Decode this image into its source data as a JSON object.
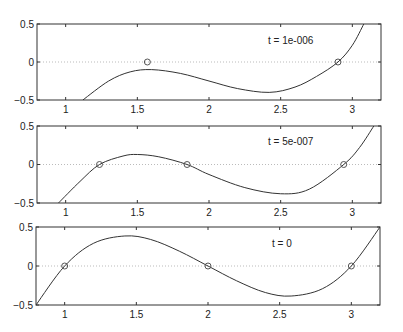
{
  "chart_data": [
    {
      "type": "line",
      "title": "",
      "annotation": "t = 1e-006",
      "xlabel": "",
      "ylabel": "",
      "xlim": [
        0.8,
        3.2
      ],
      "ylim": [
        -0.5,
        0.5
      ],
      "xticks": [
        1,
        1.5,
        2,
        2.5,
        3
      ],
      "xticklabels": [
        "1",
        "1.5",
        "2",
        "2.5",
        "3"
      ],
      "yticks": [
        -0.5,
        0,
        0.5
      ],
      "yticklabels": [
        "-0.5",
        "0",
        "0.5"
      ],
      "zero_line": true,
      "curve": {
        "description": "cubic with local max near (1.6, -0.1) and local min near (2.4, -0.4), crossing zero near x=2.9",
        "x": [
          1.12,
          1.3,
          1.45,
          1.6,
          1.8,
          2.0,
          2.2,
          2.42,
          2.6,
          2.75,
          2.9,
          3.0,
          3.08
        ],
        "y": [
          -0.5,
          -0.25,
          -0.13,
          -0.1,
          -0.15,
          -0.25,
          -0.35,
          -0.4,
          -0.33,
          -0.19,
          0.0,
          0.22,
          0.5
        ]
      },
      "markers": {
        "shape": "circle",
        "points": [
          [
            1.57,
            0.0
          ],
          [
            2.9,
            0.0
          ]
        ]
      }
    },
    {
      "type": "line",
      "title": "",
      "annotation": "t = 5e-007",
      "xlabel": "",
      "ylabel": "",
      "xlim": [
        0.8,
        3.2
      ],
      "ylim": [
        -0.5,
        0.5
      ],
      "xticks": [
        1,
        1.5,
        2,
        2.5,
        3
      ],
      "xticklabels": [
        "1",
        "1.5",
        "2",
        "2.5",
        "3"
      ],
      "yticks": [
        -0.5,
        0,
        0.5
      ],
      "yticklabels": [
        "-0.5",
        "0",
        "0.5"
      ],
      "zero_line": true,
      "curve": {
        "description": "cubic with roots near 1.24, 1.85, 2.94; local max ~0.13 near x=1.5, local min ~-0.38 near x=2.5",
        "x": [
          0.95,
          1.1,
          1.236,
          1.4,
          1.5,
          1.65,
          1.847,
          2.0,
          2.25,
          2.5,
          2.7,
          2.94,
          3.05,
          3.15
        ],
        "y": [
          -0.5,
          -0.22,
          0.0,
          0.11,
          0.13,
          0.1,
          0.0,
          -0.13,
          -0.3,
          -0.38,
          -0.32,
          0.0,
          0.22,
          0.5
        ]
      },
      "markers": {
        "shape": "circle",
        "points": [
          [
            1.236,
            0.0
          ],
          [
            1.847,
            0.0
          ],
          [
            2.94,
            0.0
          ]
        ]
      }
    },
    {
      "type": "line",
      "title": "",
      "annotation": "t = 0",
      "xlabel": "",
      "ylabel": "",
      "xlim": [
        0.8,
        3.2
      ],
      "ylim": [
        -0.5,
        0.5
      ],
      "xticks": [
        1,
        1.5,
        2,
        2.5,
        3
      ],
      "xticklabels": [
        "1",
        "1.5",
        "2",
        "2.5",
        "3"
      ],
      "yticks": [
        -0.5,
        0,
        0.5
      ],
      "yticklabels": [
        "-0.5",
        "0",
        "0.5"
      ],
      "zero_line": true,
      "curve": {
        "description": "y = (x-1)(x-2)(x-3); local max ~0.385 at x~1.42, local min ~-0.385 at x~2.58",
        "x": [
          0.8,
          1.0,
          1.2,
          1.42,
          1.6,
          1.8,
          2.0,
          2.2,
          2.4,
          2.58,
          2.8,
          3.0,
          3.2
        ],
        "y": [
          -0.5,
          0.0,
          0.29,
          0.385,
          0.34,
          0.19,
          0.0,
          -0.19,
          -0.34,
          -0.385,
          -0.29,
          0.0,
          0.5
        ]
      },
      "markers": {
        "shape": "circle",
        "points": [
          [
            1.0,
            0.0
          ],
          [
            2.0,
            0.0
          ],
          [
            3.0,
            0.0
          ]
        ]
      }
    }
  ],
  "layout": {
    "panels": [
      {
        "left": 37,
        "top": 24,
        "right": 381,
        "bottom": 100
      },
      {
        "left": 37,
        "top": 126,
        "right": 381,
        "bottom": 203
      },
      {
        "left": 36,
        "top": 227,
        "right": 380,
        "bottom": 305
      }
    ]
  },
  "panels": [
    {
      "annotation": "t = 1e-006"
    },
    {
      "annotation": "t = 5e-007"
    },
    {
      "annotation": "t = 0"
    }
  ]
}
